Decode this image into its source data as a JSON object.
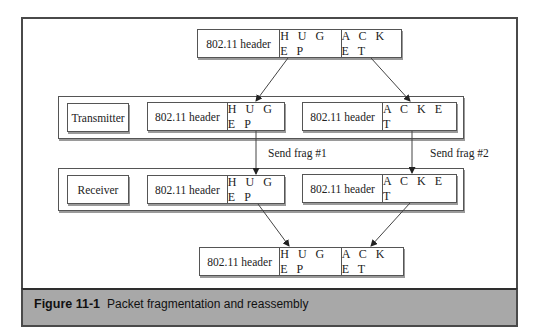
{
  "figure": {
    "number": "Figure 11-1",
    "caption": "Packet fragmentation and reassembly"
  },
  "original_packet": {
    "header": "802.11 header",
    "part1": "H U G E P",
    "part2": "A C K E T"
  },
  "transmitter": {
    "label": "Transmitter",
    "fragments": [
      {
        "header": "802.11 header",
        "payload": "H U G E P"
      },
      {
        "header": "802.11 header",
        "payload": "A C K E T"
      }
    ]
  },
  "links": [
    {
      "label": "Send frag #1"
    },
    {
      "label": "Send frag #2"
    }
  ],
  "receiver": {
    "label": "Receiver",
    "fragments": [
      {
        "header": "802.11 header",
        "payload": "H U G E P"
      },
      {
        "header": "802.11 header",
        "payload": "A C K E T"
      }
    ]
  },
  "reassembled_packet": {
    "header": "802.11 header",
    "part1": "H U G E P",
    "part2": "A C K E T"
  },
  "colors": {
    "caption_band": "#a8a8a8",
    "border": "#4a4a4a",
    "line": "#444444"
  }
}
